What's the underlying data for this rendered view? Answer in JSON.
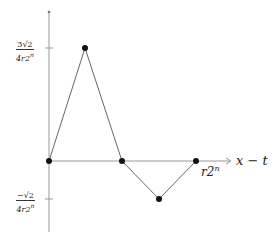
{
  "diagram": {
    "axis_label_x": "x − t",
    "tick_label_x": {
      "base": "r2",
      "exp": "n"
    },
    "tick_label_pos": {
      "num": "3√2",
      "den_base": "4r2",
      "den_exp": "n"
    },
    "tick_label_neg": {
      "num": "−√2",
      "den_base": "4r2",
      "den_exp": "n"
    },
    "colors": {
      "axis": "#888888",
      "line": "#555555",
      "point": "#111111"
    },
    "points": [
      {
        "x": 49,
        "y": 161,
        "label": "origin"
      },
      {
        "x": 85,
        "y": 48,
        "label": "peak"
      },
      {
        "x": 122,
        "y": 161,
        "label": "zero-crossing"
      },
      {
        "x": 159,
        "y": 199,
        "label": "trough"
      },
      {
        "x": 196,
        "y": 161,
        "label": "r2^n"
      }
    ]
  }
}
